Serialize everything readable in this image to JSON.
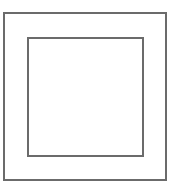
{
  "diagram": {
    "type": "nested-squares",
    "shapes": [
      {
        "id": "outer",
        "kind": "rectangle",
        "x": 3,
        "y": 12,
        "width": 164,
        "height": 169,
        "stroke": "#6b6b6b",
        "fill": "#ffffff"
      },
      {
        "id": "inner",
        "kind": "rectangle",
        "x": 27,
        "y": 37,
        "width": 117,
        "height": 120,
        "stroke": "#6b6b6b",
        "fill": "#ffffff"
      }
    ],
    "background": "#ffffff"
  }
}
